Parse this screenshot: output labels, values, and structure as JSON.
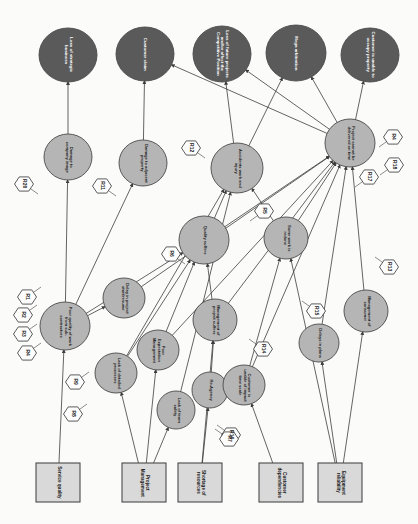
{
  "diagram": {
    "orientation": "rotated-90",
    "colors": {
      "consequence_fill": "#5a5a5a",
      "event_fill": "#b5b5b5",
      "source_fill": "#d9d9d9",
      "risk_fill": "#fdfdfd",
      "stroke": "#4a4a4a",
      "background": "#fbfbfa",
      "consequence_text": "#ffffff",
      "node_text": "#1a1a1a"
    },
    "consequences": [
      {
        "id": "C1",
        "label": "Loss of strategic business",
        "cx": 68,
        "cy": 55,
        "rx": 29,
        "ry": 27
      },
      {
        "id": "C2",
        "label": "Customer claim",
        "cx": 145,
        "cy": 54,
        "rx": 29,
        "ry": 27
      },
      {
        "id": "C3",
        "label": "Loss of future projects and/or affect the Competitive Position",
        "cx": 222,
        "cy": 54,
        "rx": 29,
        "ry": 28
      },
      {
        "id": "C4",
        "label": "Mega arbitration",
        "cx": 296,
        "cy": 53,
        "rx": 30,
        "ry": 28
      },
      {
        "id": "C5",
        "label": "Customer is unable to occupy property",
        "cx": 370,
        "cy": 55,
        "rx": 29,
        "ry": 27
      }
    ],
    "events": [
      {
        "id": "E1",
        "label": "Damage to company image",
        "cx": 68,
        "cy": 157,
        "rx": 24,
        "ry": 23
      },
      {
        "id": "E2",
        "label": "Damage to adjacent property",
        "cx": 143,
        "cy": 163,
        "rx": 24,
        "ry": 23
      },
      {
        "id": "E3",
        "label": "Accidents work and injury",
        "cx": 237,
        "cy": 168,
        "rx": 26,
        "ry": 25
      },
      {
        "id": "E4",
        "label": "Project cannot be delivered on time",
        "cx": 350,
        "cy": 143,
        "rx": 25,
        "ry": 24
      },
      {
        "id": "E5",
        "label": "Quality suffers",
        "cx": 204,
        "cy": 240,
        "rx": 25,
        "ry": 24
      },
      {
        "id": "E6",
        "label": "Some work is redone",
        "cx": 286,
        "cy": 238,
        "rx": 22,
        "ry": 21
      },
      {
        "id": "E7",
        "label": "Poor quality of work from sub-contractors",
        "cx": 65,
        "cy": 326,
        "rx": 25,
        "ry": 24
      },
      {
        "id": "E8",
        "label": "Delay in project start/resume",
        "cx": 124,
        "cy": 298,
        "rx": 21,
        "ry": 20
      },
      {
        "id": "E9",
        "label": "Lack of detailed processes",
        "cx": 116,
        "cy": 373,
        "rx": 21,
        "ry": 20
      },
      {
        "id": "E10",
        "label": "Poor Expectation Management",
        "cx": 158,
        "cy": 350,
        "rx": 21,
        "ry": 20
      },
      {
        "id": "E11",
        "label": "Lack of team safety",
        "cx": 176,
        "cy": 410,
        "rx": 19,
        "ry": 19
      },
      {
        "id": "E12",
        "label": "Management of project suffers",
        "cx": 215,
        "cy": 320,
        "rx": 22,
        "ry": 21
      },
      {
        "id": "E13",
        "label": "Re-Agency",
        "cx": 210,
        "cy": 390,
        "rx": 18,
        "ry": 18
      },
      {
        "id": "E14",
        "label": "Customer is unable of impact time scale",
        "cx": 244,
        "cy": 385,
        "rx": 21,
        "ry": 20
      },
      {
        "id": "E15",
        "label": "Delays in plans",
        "cx": 319,
        "cy": 343,
        "rx": 20,
        "ry": 19
      },
      {
        "id": "E16",
        "label": "Management of consumer",
        "cx": 366,
        "cy": 311,
        "rx": 22,
        "ry": 21
      }
    ],
    "sources": [
      {
        "id": "S1",
        "label": "Service quality",
        "x": 36,
        "y": 463,
        "w": 44,
        "h": 39
      },
      {
        "id": "S2",
        "label": "Project Management",
        "x": 122,
        "y": 463,
        "w": 44,
        "h": 39
      },
      {
        "id": "S3",
        "label": "Shortage of resources",
        "x": 178,
        "y": 463,
        "w": 44,
        "h": 39
      },
      {
        "id": "S4",
        "label": "Customer dependencies",
        "x": 259,
        "y": 463,
        "w": 44,
        "h": 39
      },
      {
        "id": "S5",
        "label": "Equipment reliability",
        "x": 318,
        "y": 463,
        "w": 44,
        "h": 39
      }
    ],
    "risks": [
      {
        "id": "RK1",
        "label": "R20",
        "cx": 24,
        "cy": 184
      },
      {
        "id": "RK2",
        "label": "R11",
        "cx": 102,
        "cy": 186
      },
      {
        "id": "RK3",
        "label": "R12",
        "cx": 191,
        "cy": 148
      },
      {
        "id": "RK4",
        "label": "R4",
        "cx": 393,
        "cy": 137
      },
      {
        "id": "RK5",
        "label": "R18",
        "cx": 394,
        "cy": 165
      },
      {
        "id": "RK6",
        "label": "R17",
        "cx": 369,
        "cy": 177
      },
      {
        "id": "RK7",
        "label": "R6",
        "cx": 171,
        "cy": 254
      },
      {
        "id": "RK8",
        "label": "R5",
        "cx": 264,
        "cy": 211
      },
      {
        "id": "RK9",
        "label": "R13",
        "cx": 389,
        "cy": 267
      },
      {
        "id": "RK10",
        "label": "R1",
        "cx": 27,
        "cy": 297
      },
      {
        "id": "RK11",
        "label": "R2",
        "cx": 23,
        "cy": 315
      },
      {
        "id": "RK12",
        "label": "R3",
        "cx": 23,
        "cy": 334
      },
      {
        "id": "RK13",
        "label": "R4",
        "cx": 27,
        "cy": 353
      },
      {
        "id": "RK14",
        "label": "R9",
        "cx": 75,
        "cy": 382
      },
      {
        "id": "RK15",
        "label": "R8",
        "cx": 73,
        "cy": 414
      },
      {
        "id": "RK16",
        "label": "R14",
        "cx": 263,
        "cy": 349
      },
      {
        "id": "RK17",
        "label": "R15",
        "cx": 316,
        "cy": 311
      },
      {
        "id": "RK18",
        "label": "R16",
        "cx": 231,
        "cy": 435
      },
      {
        "id": "RK19",
        "label": "R7",
        "cx": 229,
        "cy": 439
      }
    ],
    "edges": [
      {
        "from": "E1",
        "to": "C1"
      },
      {
        "from": "E2",
        "to": "C2"
      },
      {
        "from": "E3",
        "to": "C3"
      },
      {
        "from": "E3",
        "to": "C4"
      },
      {
        "from": "E4",
        "to": "C3"
      },
      {
        "from": "E4",
        "to": "C4"
      },
      {
        "from": "E4",
        "to": "C5"
      },
      {
        "from": "E4",
        "to": "C2"
      },
      {
        "from": "E5",
        "to": "E3"
      },
      {
        "from": "E5",
        "to": "E4"
      },
      {
        "from": "E6",
        "to": "E4"
      },
      {
        "from": "E6",
        "to": "E3"
      },
      {
        "from": "E7",
        "to": "E1"
      },
      {
        "from": "E7",
        "to": "E2"
      },
      {
        "from": "E7",
        "to": "E5"
      },
      {
        "from": "E7",
        "to": "E8"
      },
      {
        "from": "E8",
        "to": "E4"
      },
      {
        "from": "E9",
        "to": "E5"
      },
      {
        "from": "E9",
        "to": "E3"
      },
      {
        "from": "E10",
        "to": "E5"
      },
      {
        "from": "E10",
        "to": "E4"
      },
      {
        "from": "E11",
        "to": "E3"
      },
      {
        "from": "E12",
        "to": "E5"
      },
      {
        "from": "E12",
        "to": "E4"
      },
      {
        "from": "E13",
        "to": "E12"
      },
      {
        "from": "E14",
        "to": "E6"
      },
      {
        "from": "E14",
        "to": "E4"
      },
      {
        "from": "E15",
        "to": "E4"
      },
      {
        "from": "E16",
        "to": "E4"
      },
      {
        "from": "S1",
        "to": "E7"
      },
      {
        "from": "S2",
        "to": "E9"
      },
      {
        "from": "S2",
        "to": "E10"
      },
      {
        "from": "S2",
        "to": "E11"
      },
      {
        "from": "S3",
        "to": "E13"
      },
      {
        "from": "S3",
        "to": "E12"
      },
      {
        "from": "S4",
        "to": "E14"
      },
      {
        "from": "S5",
        "to": "E15"
      },
      {
        "from": "S5",
        "to": "E16"
      },
      {
        "from": "S5",
        "to": "E6"
      }
    ]
  }
}
